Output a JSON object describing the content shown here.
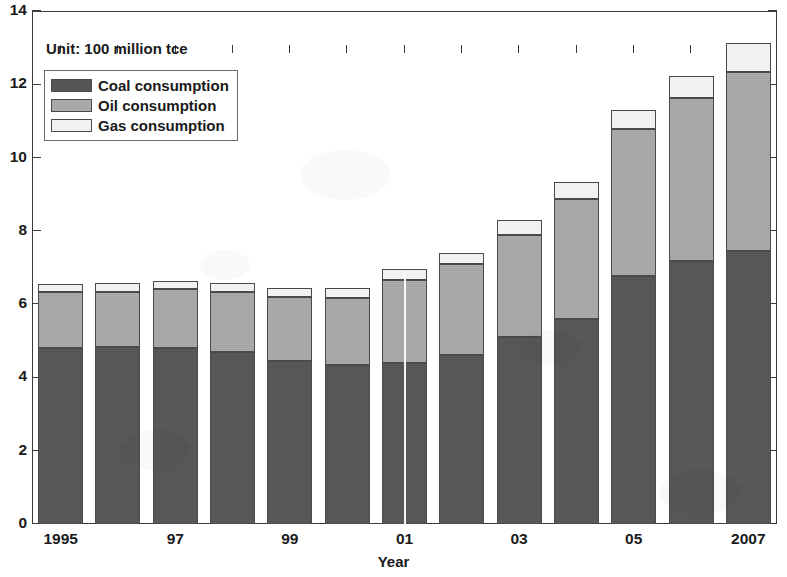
{
  "chart_data": {
    "type": "bar",
    "subtype": "stacked-bar",
    "title": "",
    "unit_caption": "Unit: 100 million tce",
    "xlabel": "Year",
    "ylabel": "",
    "ylim": [
      0,
      14
    ],
    "ytick_values": [
      0,
      2,
      4,
      6,
      8,
      10,
      12,
      14
    ],
    "ytick_labels": [
      "0",
      "2",
      "4",
      "6",
      "8",
      "10",
      "12",
      "14"
    ],
    "grid": false,
    "legend_position": "upper-left",
    "categories": [
      "1995",
      "1996",
      "1997",
      "1998",
      "1999",
      "2000",
      "2001",
      "2002",
      "2003",
      "2004",
      "2005",
      "2006",
      "2007"
    ],
    "xtick_labels": [
      "1995",
      "",
      "97",
      "",
      "99",
      "",
      "01",
      "",
      "03",
      "",
      "05",
      "",
      "2007"
    ],
    "series": [
      {
        "name": "Coal consumption",
        "color": "#565656",
        "values": [
          4.8,
          4.84,
          4.8,
          4.7,
          4.46,
          4.33,
          4.4,
          4.6,
          5.1,
          5.6,
          6.77,
          7.17,
          7.45
        ]
      },
      {
        "name": "Oil consumption",
        "color": "#a9a9a9",
        "values": [
          1.52,
          1.5,
          1.6,
          1.64,
          1.73,
          1.85,
          2.27,
          2.5,
          2.8,
          3.28,
          4.02,
          4.45,
          4.88
        ]
      },
      {
        "name": "Gas consumption",
        "color": "#f1f1f1",
        "values": [
          0.24,
          0.24,
          0.24,
          0.24,
          0.24,
          0.25,
          0.3,
          0.3,
          0.4,
          0.45,
          0.51,
          0.6,
          0.8
        ]
      }
    ],
    "totals": [
      6.56,
      6.58,
      6.64,
      6.58,
      6.43,
      6.43,
      6.97,
      7.4,
      8.3,
      9.33,
      11.3,
      12.22,
      13.13
    ]
  },
  "legend": {
    "items": [
      {
        "label": "Coal consumption",
        "color": "#565656"
      },
      {
        "label": "Oil consumption",
        "color": "#a9a9a9"
      },
      {
        "label": "Gas consumption",
        "color": "#f1f1f1"
      }
    ]
  }
}
